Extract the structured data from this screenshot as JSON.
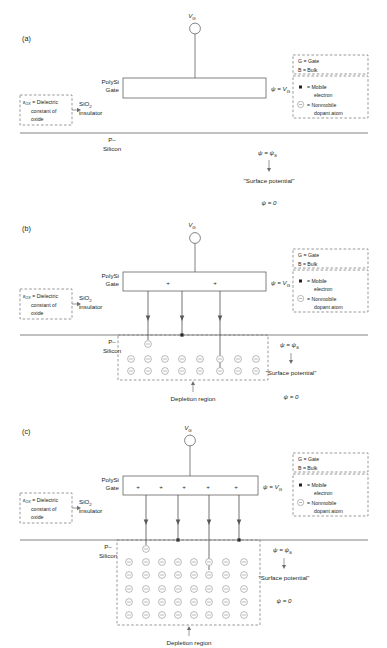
{
  "figure": {
    "title_present": false,
    "width": 387,
    "height": 648,
    "colors": {
      "line": "#58595b",
      "dash": "#6d6e71",
      "text": "#231f20",
      "electron": "#231f20",
      "background": "#ffffff"
    }
  },
  "labels": {
    "panel_a": "(a)",
    "panel_b": "(b)",
    "panel_c": "(c)",
    "vg_terminal": "V",
    "vg_sub": "G",
    "polysi": "PolySi",
    "gate": "Gate",
    "sio2": "SiO",
    "sio2_sub": "2",
    "insulator": "insulator",
    "p_minus": "P–",
    "silicon": "Silicon",
    "psi_eq_vg_prefix": "ψ = ",
    "psi_eq_vg_value": "V",
    "psi_eq_vg_sub": "G",
    "psi_eq_psis_prefix": "ψ = ",
    "psi_eq_psis_value": "ψ",
    "psi_eq_psis_sub": "S",
    "surface_potential": "\"Surface potential\"",
    "psi_zero": "ψ = 0",
    "depletion_region": "Depletion region",
    "plus": "+"
  },
  "dielectric_box": {
    "eps_symbol": "ε",
    "eps_sub": "OX",
    "line1_rest": " = Dielectric",
    "line2": "constant of",
    "line3": "oxide"
  },
  "legend": {
    "top": [
      {
        "symbol": "G",
        "eq": "=",
        "text": "Gate"
      },
      {
        "symbol": "B",
        "eq": "=",
        "text": "Bulk"
      }
    ],
    "bottom": [
      {
        "icon": "filled-square",
        "eq": "=",
        "line1": "Mobile",
        "line2": "electron"
      },
      {
        "icon": "circled-minus",
        "eq": "=",
        "line1": "Nonmobile",
        "line2": "dopant atom"
      }
    ]
  },
  "panels": [
    {
      "id": "a",
      "label": "(a)",
      "gate_plus_count": 0,
      "field_line_count": 0,
      "depletion_rows": 0,
      "depletion_cols": 0,
      "has_depletion_region": false,
      "surface_electrons": 0,
      "state": "flat-band"
    },
    {
      "id": "b",
      "label": "(b)",
      "gate_plus_count": 2,
      "field_line_count": 3,
      "depletion_rows": 2,
      "depletion_cols": 8,
      "has_depletion_region": true,
      "surface_electrons": 1,
      "subsurface_dopants": 1,
      "state": "depletion"
    },
    {
      "id": "c",
      "label": "(c)",
      "gate_plus_count": 5,
      "field_line_count": 4,
      "depletion_rows": 5,
      "depletion_cols": 8,
      "has_depletion_region": true,
      "surface_electrons": 2,
      "subsurface_dopants": 1,
      "state": "deep-depletion"
    }
  ]
}
